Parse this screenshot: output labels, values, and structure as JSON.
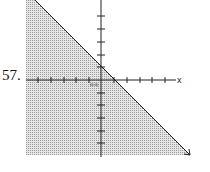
{
  "problem": {
    "number": "57."
  },
  "graph": {
    "x_axis_label": "x",
    "origin_label": "(0,0)",
    "shading_color": "#bdbdbd",
    "line_color": "#222222",
    "description": "Shaded half-plane below a line with negative slope, y-intercept at 1 and x-intercept at 1"
  }
}
